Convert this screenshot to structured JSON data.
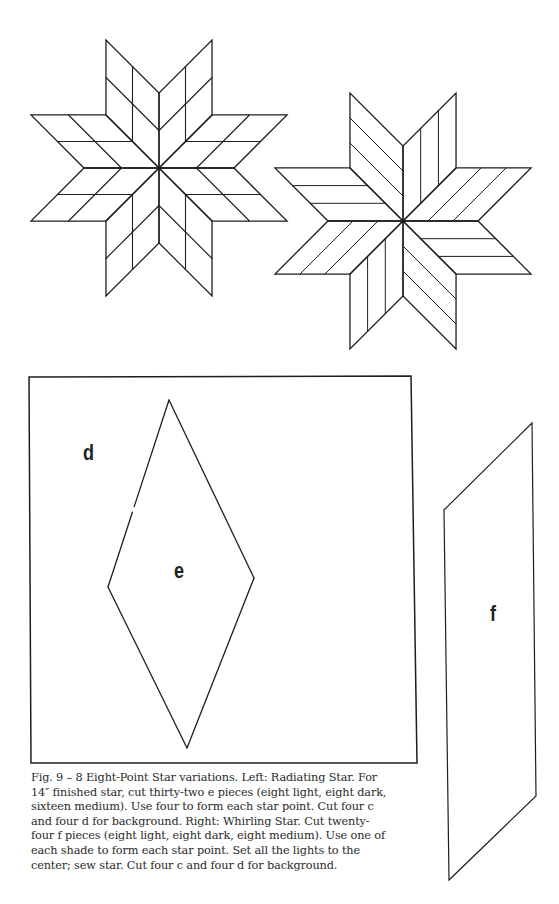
{
  "figure": {
    "number": "Fig. 9 – 8",
    "stroke_color": "#1e1e1e",
    "left_star": {
      "name": "Radiating Star",
      "center": [
        159,
        168
      ],
      "ray_length": 75,
      "pattern": "grid-2x2"
    },
    "right_star": {
      "name": "Whirling Star",
      "center": [
        403,
        221
      ],
      "ray_length": 75,
      "pattern": "strips-3"
    },
    "background_block": {
      "x1": 29,
      "y1": 377,
      "x2": 413,
      "y2": 763
    },
    "rhombus_e": {
      "points": [
        [
          169,
          400
        ],
        [
          254,
          578
        ],
        [
          187,
          748
        ],
        [
          108,
          587
        ]
      ],
      "gap_at": [
        132,
        513
      ]
    },
    "parallelogram_f": {
      "points": [
        [
          532,
          423
        ],
        [
          536,
          796
        ],
        [
          449,
          880
        ],
        [
          444,
          510
        ]
      ]
    },
    "labels": {
      "d": {
        "text": "d",
        "x": 83,
        "y": 440
      },
      "e": {
        "text": "e",
        "x": 174,
        "y": 558
      },
      "f": {
        "text": "f",
        "x": 490,
        "y": 601
      }
    }
  },
  "caption": {
    "lines": [
      "Fig. 9 – 8 Eight-Point Star variations. Left: Radiating Star. For",
      "14″ finished star, cut thirty-two e pieces (eight light, eight dark,",
      "sixteen medium). Use four to form each star point. Cut four c",
      "and four d for background. Right: Whirling Star. Cut twenty-",
      "four f pieces (eight light, eight dark, eight medium). Use one of",
      "each shade to form each star point. Set all the lights to the",
      "center; sew star. Cut four c and four d for background."
    ]
  }
}
